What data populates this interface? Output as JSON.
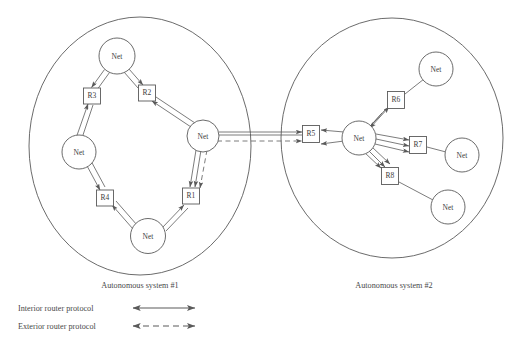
{
  "diagram": {
    "title_present": false,
    "background_color": "#ffffff",
    "stroke_color": "#5a5a5a",
    "text_color": "#444444",
    "autonomous_systems": [
      {
        "id": "as1",
        "caption": "Autonomous system #1",
        "caption_x": 140,
        "caption_y": 285,
        "ellipse": {
          "cx": 140,
          "cy": 146,
          "rx": 111,
          "ry": 129
        },
        "networks": [
          {
            "name": "net-top",
            "label": "Net",
            "cx": 117,
            "cy": 56,
            "r": 18
          },
          {
            "name": "net-left",
            "label": "Net",
            "cx": 79,
            "cy": 152,
            "r": 17
          },
          {
            "name": "net-bottom",
            "label": "Net",
            "cx": 148,
            "cy": 236,
            "r": 17.5
          },
          {
            "name": "net-right",
            "label": "Net",
            "cx": 203,
            "cy": 136,
            "r": 16
          }
        ],
        "routers": [
          {
            "name": "router-r3",
            "label": "R3",
            "cx": 92,
            "cy": 96,
            "w": 17,
            "h": 16
          },
          {
            "name": "router-r2",
            "label": "R2",
            "cx": 147,
            "cy": 93,
            "w": 17,
            "h": 16
          },
          {
            "name": "router-r4",
            "label": "R4",
            "cx": 105,
            "cy": 198,
            "w": 17,
            "h": 16
          },
          {
            "name": "router-r1",
            "label": "R1",
            "cx": 191,
            "cy": 196,
            "w": 17,
            "h": 16
          }
        ]
      },
      {
        "id": "as2",
        "caption": "Autonomous system #2",
        "caption_x": 394,
        "caption_y": 285,
        "ellipse": {
          "cx": 392,
          "cy": 138,
          "rx": 111,
          "ry": 120
        },
        "networks": [
          {
            "name": "net-hub",
            "label": "Net",
            "cx": 359,
            "cy": 138,
            "r": 17
          },
          {
            "name": "net-upper-right",
            "label": "Net",
            "cx": 436,
            "cy": 69,
            "r": 17
          },
          {
            "name": "net-middle-right",
            "label": "Net",
            "cx": 462,
            "cy": 155,
            "r": 17
          },
          {
            "name": "net-lower-right",
            "label": "Net",
            "cx": 448,
            "cy": 207,
            "r": 17
          }
        ],
        "routers": [
          {
            "name": "router-r5",
            "label": "R5",
            "cx": 311,
            "cy": 134,
            "w": 17,
            "h": 17
          },
          {
            "name": "router-r6",
            "label": "R6",
            "cx": 396,
            "cy": 100,
            "w": 17,
            "h": 17
          },
          {
            "name": "router-r7",
            "label": "R7",
            "cx": 418,
            "cy": 145,
            "w": 17,
            "h": 17
          },
          {
            "name": "router-r8",
            "label": "R8",
            "cx": 390,
            "cy": 176,
            "w": 17,
            "h": 17
          }
        ]
      }
    ],
    "inter_as_link": {
      "name": "inter-as-link",
      "protocol": "exterior",
      "from": "net-right (AS1)",
      "to": "router-r5 (AS2)"
    },
    "legend": {
      "items": [
        {
          "name": "legend-interior",
          "label": "Interior router protocol",
          "style": "solid",
          "label_x": 18,
          "label_y": 308,
          "line_x1": 132,
          "line_x2": 196,
          "line_y": 306
        },
        {
          "name": "legend-exterior",
          "label": "Exterior router protocol",
          "style": "dashed",
          "label_x": 18,
          "label_y": 326,
          "line_x1": 132,
          "line_x2": 196,
          "line_y": 324
        }
      ]
    }
  }
}
